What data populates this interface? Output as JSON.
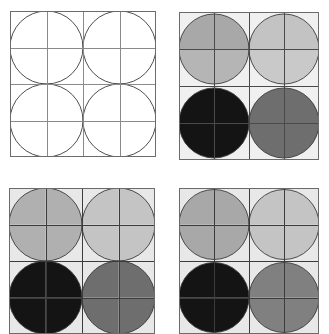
{
  "figure": {
    "title": "",
    "background_color": "#ffffff",
    "width": 329,
    "height": 311,
    "panel_count": 4,
    "layout": "2x2 grid of panels"
  },
  "palette": {
    "white": "#ffffff",
    "panel_bg_light": "#f0f0f0",
    "grid_line": "#555555",
    "circle_outline": "#3a3a3a",
    "border": "#6b6b6b",
    "light_gray": "#c9c9c9",
    "mid_gray": "#a8a8a8",
    "dark_gray": "#6e6e6e",
    "near_black": "#141414"
  },
  "chart_data": {
    "type": "heatmap",
    "xlabel": "",
    "ylabel": "",
    "grid": true,
    "legend": "none",
    "grid_cells": 4,
    "circle_radius_cells": 1,
    "circle_centers_cells": [
      [
        1,
        1
      ],
      [
        3,
        1
      ],
      [
        1,
        3
      ],
      [
        3,
        3
      ]
    ],
    "panels": [
      {
        "id": "panel-top-left",
        "label": "",
        "x": 10,
        "y": 11,
        "w": 146,
        "h": 146,
        "background": "#ffffff",
        "border": "#6b6b6b",
        "grid_line": "#8a8a8a",
        "circles": [
          {
            "cx": 1,
            "cy": 1,
            "quadrants": [
              "#ffffff",
              "#ffffff",
              "#ffffff",
              "#ffffff"
            ]
          },
          {
            "cx": 3,
            "cy": 1,
            "quadrants": [
              "#ffffff",
              "#ffffff",
              "#ffffff",
              "#ffffff"
            ]
          },
          {
            "cx": 1,
            "cy": 3,
            "quadrants": [
              "#ffffff",
              "#ffffff",
              "#ffffff",
              "#ffffff"
            ]
          },
          {
            "cx": 3,
            "cy": 3,
            "quadrants": [
              "#ffffff",
              "#ffffff",
              "#ffffff",
              "#ffffff"
            ]
          }
        ]
      },
      {
        "id": "panel-top-right",
        "label": "",
        "x": 179,
        "y": 12,
        "w": 140,
        "h": 148,
        "background": "#f0f0f0",
        "border": "#6b6b6b",
        "grid_line": "#4a4a4a",
        "circles": [
          {
            "cx": 1,
            "cy": 1,
            "quadrants": [
              "#a8a8a8",
              "#a8a8a8",
              "#b5b5b5",
              "#b5b5b5"
            ]
          },
          {
            "cx": 3,
            "cy": 1,
            "quadrants": [
              "#c3c3c3",
              "#c3c3c3",
              "#c9c9c9",
              "#c9c9c9"
            ]
          },
          {
            "cx": 1,
            "cy": 3,
            "quadrants": [
              "#141414",
              "#141414",
              "#141414",
              "#141414"
            ]
          },
          {
            "cx": 3,
            "cy": 3,
            "quadrants": [
              "#6e6e6e",
              "#6e6e6e",
              "#6e6e6e",
              "#6e6e6e"
            ]
          }
        ]
      },
      {
        "id": "panel-bottom-left",
        "label": "",
        "x": 9,
        "y": 188,
        "w": 146,
        "h": 146,
        "background": "#e8e8e8",
        "border": "#6b6b6b",
        "grid_line": "#3c3c3c",
        "circles": [
          {
            "cx": 1,
            "cy": 1,
            "quadrants": [
              "#b0b0b0",
              "#b0b0b0",
              "#b0b0b0",
              "#b0b0b0"
            ]
          },
          {
            "cx": 3,
            "cy": 1,
            "quadrants": [
              "#c4c4c4",
              "#c4c4c4",
              "#c4c4c4",
              "#c4c4c4"
            ]
          },
          {
            "cx": 1,
            "cy": 3,
            "quadrants": [
              "#141414",
              "#141414",
              "#141414",
              "#141414"
            ]
          },
          {
            "cx": 3,
            "cy": 3,
            "quadrants": [
              "#6e6e6e",
              "#6e6e6e",
              "#6e6e6e",
              "#6e6e6e"
            ]
          }
        ]
      },
      {
        "id": "panel-bottom-right",
        "label": "",
        "x": 179,
        "y": 188,
        "w": 140,
        "h": 146,
        "background": "#e8e8e8",
        "border": "#6b6b6b",
        "grid_line": "#3c3c3c",
        "circles": [
          {
            "cx": 1,
            "cy": 1,
            "quadrants": [
              "#a8a8a8",
              "#a8a8a8",
              "#a8a8a8",
              "#a8a8a8"
            ]
          },
          {
            "cx": 3,
            "cy": 1,
            "quadrants": [
              "#c4c4c4",
              "#c4c4c4",
              "#c4c4c4",
              "#c4c4c4"
            ]
          },
          {
            "cx": 1,
            "cy": 3,
            "quadrants": [
              "#141414",
              "#141414",
              "#141414",
              "#141414"
            ]
          },
          {
            "cx": 3,
            "cy": 3,
            "quadrants": [
              "#808080",
              "#808080",
              "#808080",
              "#808080"
            ]
          }
        ]
      }
    ]
  }
}
